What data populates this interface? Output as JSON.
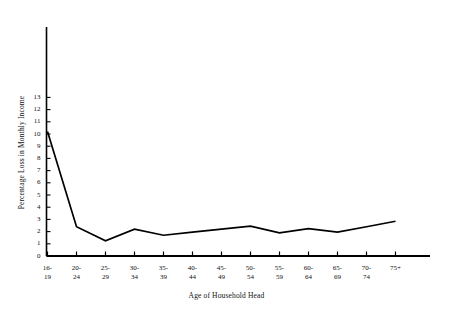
{
  "chart_data": {
    "type": "line",
    "title": "",
    "xlabel": "Age of Household Head",
    "ylabel": "Percentage Loss in Monthly Income",
    "categories": [
      "16-\n19",
      "20-\n24",
      "25-\n29",
      "30-\n34",
      "35-\n39",
      "40-\n44",
      "45-\n49",
      "50-\n54",
      "55-\n59",
      "60-\n64",
      "65-\n69",
      "70-\n74",
      "75+"
    ],
    "categories_flat": [
      "16-19",
      "20-24",
      "25-29",
      "30-34",
      "35-39",
      "40-44",
      "45-49",
      "50-54",
      "55-59",
      "60-64",
      "65-69",
      "70-74",
      "75+"
    ],
    "values": [
      10.2,
      2.4,
      1.25,
      2.2,
      1.7,
      1.95,
      2.2,
      2.45,
      1.9,
      2.25,
      1.95,
      2.4,
      2.85
    ],
    "ylim": [
      0,
      13.8
    ],
    "yticks": [
      0,
      1,
      2,
      3,
      4,
      5,
      6,
      7,
      8,
      9,
      10,
      11,
      12,
      13
    ],
    "ytick_labels": [
      "0",
      "1",
      "2",
      "3",
      "4",
      "5",
      "6",
      "7",
      "8",
      "9",
      "10",
      "11",
      "12",
      "13"
    ],
    "grid": false,
    "legend": null,
    "line_color": "#000000",
    "axis_color": "#000000"
  },
  "axes": {
    "y_title": "Percentage Loss in Monthly Income",
    "x_title": "Age of Household Head"
  }
}
